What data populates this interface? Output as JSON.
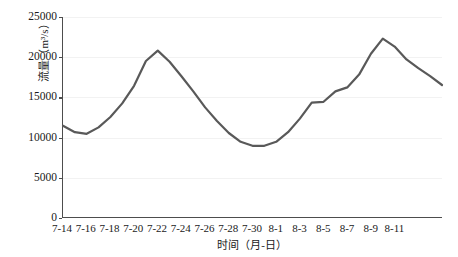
{
  "chart_data": {
    "type": "line",
    "title": "",
    "xlabel": "时间（月-日）",
    "ylabel": "流量（m³/s）",
    "ylim": [
      0,
      25000
    ],
    "yticks": [
      0,
      5000,
      10000,
      15000,
      20000,
      25000
    ],
    "ytick_labels": [
      "0",
      "5000",
      "10000",
      "15000",
      "20000",
      "25000"
    ],
    "grid": true,
    "legend": "none",
    "line_color": "#595959",
    "line_width": 2.2,
    "x": [
      "7-14",
      "7-15",
      "7-16",
      "7-17",
      "7-18",
      "7-19",
      "7-20",
      "7-21",
      "7-22",
      "7-23",
      "7-24",
      "7-25",
      "7-26",
      "7-27",
      "7-28",
      "7-29",
      "7-30",
      "7-31",
      "8-1",
      "8-2",
      "8-3",
      "8-4",
      "8-5",
      "8-6",
      "8-7",
      "8-8",
      "8-9",
      "8-10",
      "8-11",
      "8-12"
    ],
    "xtick_labels": [
      "7-14",
      "7-16",
      "7-18",
      "7-20",
      "7-22",
      "7-24",
      "7-26",
      "7-28",
      "7-30",
      "8-1",
      "8-3",
      "8-5",
      "8-7",
      "8-9",
      "8-11"
    ],
    "xtick_indices": [
      0,
      2,
      4,
      6,
      8,
      10,
      12,
      14,
      16,
      18,
      20,
      22,
      24,
      26,
      28
    ],
    "values": [
      11400,
      10600,
      10400,
      11200,
      12500,
      14200,
      16400,
      19500,
      20800,
      19400,
      17600,
      15700,
      13700,
      12000,
      10500,
      9400,
      8900,
      8900,
      9400,
      10600,
      12300,
      14300,
      14400,
      15700,
      16200,
      17800,
      20400,
      22300,
      21300,
      19700
    ],
    "values_tail": [
      18600,
      17600,
      16500
    ],
    "series_name": "流量"
  }
}
